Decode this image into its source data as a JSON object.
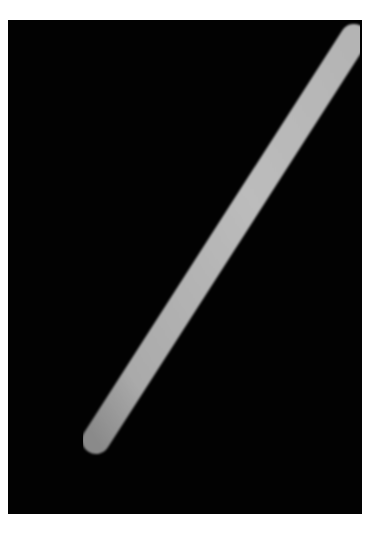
{
  "image": {
    "subject": "rod",
    "background_color": "#020202",
    "rod_color": "#b8b8b8",
    "rod_highlight": "#c4c4c4",
    "rod_end_color": "#8e8e8e",
    "frame": {
      "x": 8,
      "y": 20,
      "width": 354,
      "height": 494
    }
  },
  "caption": {
    "text": ""
  }
}
